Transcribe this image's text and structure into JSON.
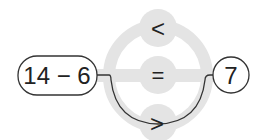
{
  "expression": "14 − 6",
  "result": "7",
  "choices": {
    "top": "<",
    "middle": "=",
    "bottom": ">"
  },
  "selected_choice": "bottom",
  "colors": {
    "ring": "#e4e4e4",
    "line": "#333333",
    "text": "#222222"
  }
}
